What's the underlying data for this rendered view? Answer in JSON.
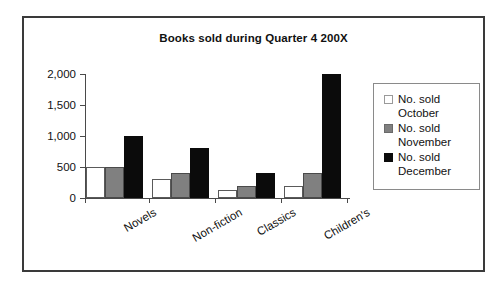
{
  "chart_data": {
    "type": "bar",
    "title": "Books sold during Quarter 4 200X",
    "xlabel": "",
    "ylabel": "",
    "categories": [
      "Novels",
      "Non-fiction",
      "Classics",
      "Children's"
    ],
    "series": [
      {
        "name": "No. sold October",
        "color": "#ffffff",
        "values": [
          500,
          300,
          130,
          200
        ]
      },
      {
        "name": "No. sold November",
        "color": "#808080",
        "values": [
          500,
          400,
          200,
          400
        ]
      },
      {
        "name": "No. sold December",
        "color": "#000000",
        "values": [
          1000,
          800,
          400,
          2000
        ]
      }
    ],
    "ylim": [
      0,
      2000
    ],
    "yticks": [
      0,
      500,
      1000,
      1500,
      2000
    ],
    "ytick_labels": [
      "0",
      "500",
      "1,000",
      "1,500",
      "2,000"
    ],
    "grid": false,
    "legend_position": "right",
    "category_label_rotation": -30
  },
  "legend": {
    "items": [
      {
        "line1": "No. sold",
        "line2": "October"
      },
      {
        "line1": "No. sold",
        "line2": "November"
      },
      {
        "line1": "No. sold",
        "line2": "December"
      }
    ]
  },
  "colors": {
    "frame_border": "#3a3a3a",
    "axis": "#4a4a4a",
    "text": "#111111",
    "series_october": "#ffffff",
    "series_november": "#808080",
    "series_december": "#000000"
  }
}
